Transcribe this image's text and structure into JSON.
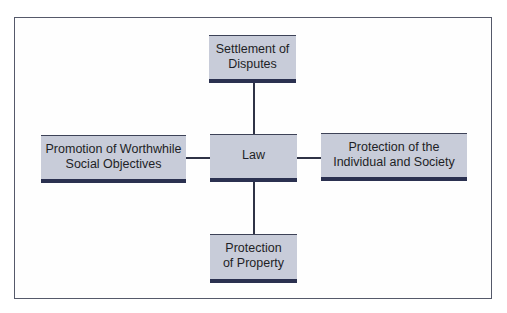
{
  "diagram": {
    "type": "hub-and-spoke",
    "center": {
      "label": "Law"
    },
    "nodes": {
      "top": {
        "line1": "Settlement of",
        "line2": "Disputes"
      },
      "left": {
        "line1": "Promotion of Worthwhile",
        "line2": "Social Objectives"
      },
      "right": {
        "line1": "Protection of the",
        "line2": "Individual and Society"
      },
      "bottom": {
        "line1": "Protection",
        "line2": "of Property"
      }
    },
    "colors": {
      "box_fill": "#c8ccd9",
      "box_bottom_bar": "#2b3150",
      "connector": "#2f3346",
      "frame_border": "#55596a"
    }
  }
}
